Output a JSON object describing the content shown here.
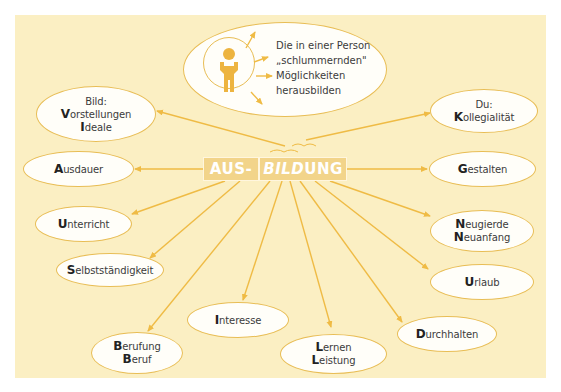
{
  "colors": {
    "panel_background": "#fbefc3",
    "line_color": "#efbb45",
    "node_border": "#e8bd55",
    "node_fill": "#fffef9",
    "center_box_fill": "#f2d48a",
    "center_text": "#ffffff",
    "person_icon": "#edb440"
  },
  "top_bubble": {
    "icon": "person-arms-raised-icon",
    "lines": [
      "Die in einer Person",
      "„schlummernden\"",
      "Möglichkeiten",
      "herausbilden"
    ]
  },
  "center": {
    "prefix": "AUS-",
    "word_italic_part": "BILD",
    "word_rest": "UNG"
  },
  "nodes": [
    {
      "id": "bild",
      "lines": [
        {
          "cap": "",
          "rest": "Bild:"
        },
        {
          "cap": "V",
          "rest": "orstellungen"
        },
        {
          "cap": "I",
          "rest": "deale"
        }
      ]
    },
    {
      "id": "ausdauer",
      "lines": [
        {
          "cap": "A",
          "rest": "usdauer"
        }
      ]
    },
    {
      "id": "unterricht",
      "lines": [
        {
          "cap": "U",
          "rest": "nterricht"
        }
      ]
    },
    {
      "id": "selbststaendigkeit",
      "lines": [
        {
          "cap": "S",
          "rest": "elbstständigkeit"
        }
      ]
    },
    {
      "id": "berufung",
      "lines": [
        {
          "cap": "B",
          "rest": "erufung"
        },
        {
          "cap": "B",
          "rest": "eruf"
        }
      ]
    },
    {
      "id": "interesse",
      "lines": [
        {
          "cap": "I",
          "rest": "nteresse"
        }
      ]
    },
    {
      "id": "lernen",
      "lines": [
        {
          "cap": "L",
          "rest": "ernen"
        },
        {
          "cap": "L",
          "rest": "eistung"
        }
      ]
    },
    {
      "id": "durchhalten",
      "lines": [
        {
          "cap": "D",
          "rest": "urchhalten"
        }
      ]
    },
    {
      "id": "urlaub",
      "lines": [
        {
          "cap": "U",
          "rest": "rlaub"
        }
      ]
    },
    {
      "id": "neugierde",
      "lines": [
        {
          "cap": "N",
          "rest": "eugierde"
        },
        {
          "cap": "N",
          "rest": "euanfang"
        }
      ]
    },
    {
      "id": "gestalten",
      "lines": [
        {
          "cap": "G",
          "rest": "estalten"
        }
      ]
    },
    {
      "id": "du",
      "lines": [
        {
          "cap": "",
          "rest": "Du:"
        },
        {
          "cap": "K",
          "rest": "ollegialität"
        }
      ]
    }
  ]
}
